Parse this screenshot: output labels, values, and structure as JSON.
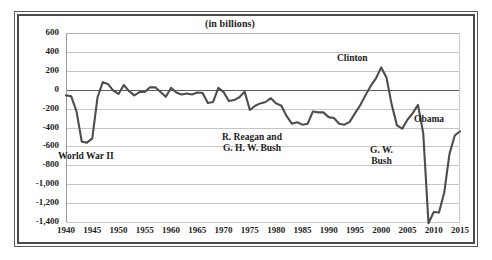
{
  "chart_data": {
    "type": "line",
    "title": "(in billions)",
    "subtitle": "",
    "xlabel": "",
    "ylabel": "",
    "xlim": [
      1940,
      2015
    ],
    "ylim": [
      -1400,
      600
    ],
    "grid": true,
    "legend_position": "none",
    "line_color": "#4d4d4d",
    "x_ticks": [
      1940,
      1945,
      1950,
      1955,
      1960,
      1965,
      1970,
      1975,
      1980,
      1985,
      1990,
      1995,
      2000,
      2005,
      2010,
      2015
    ],
    "y_ticks": [
      600,
      400,
      200,
      0,
      -200,
      -400,
      -600,
      -800,
      -1000,
      -1200,
      -1400
    ],
    "y_tick_labels": [
      "600",
      "400",
      "200",
      "0",
      "-200",
      "-400",
      "-600",
      "-800",
      "-1,000",
      "-1,200",
      "-1,400"
    ],
    "series": [
      {
        "name": "Federal surplus or deficit",
        "x": [
          1940,
          1941,
          1942,
          1943,
          1944,
          1945,
          1946,
          1947,
          1948,
          1949,
          1950,
          1951,
          1952,
          1953,
          1954,
          1955,
          1956,
          1957,
          1958,
          1959,
          1960,
          1961,
          1962,
          1963,
          1964,
          1965,
          1966,
          1967,
          1968,
          1969,
          1970,
          1971,
          1972,
          1973,
          1974,
          1975,
          1976,
          1977,
          1978,
          1979,
          1980,
          1981,
          1982,
          1983,
          1984,
          1985,
          1986,
          1987,
          1988,
          1989,
          1990,
          1991,
          1992,
          1993,
          1994,
          1995,
          1996,
          1997,
          1998,
          1999,
          2000,
          2001,
          2002,
          2003,
          2004,
          2005,
          2006,
          2007,
          2008,
          2009,
          2010,
          2011,
          2012,
          2013,
          2014,
          2015
        ],
        "values": [
          -60,
          -70,
          -230,
          -550,
          -560,
          -515,
          -80,
          80,
          60,
          -10,
          -45,
          50,
          -15,
          -60,
          -25,
          -25,
          25,
          25,
          -25,
          -75,
          20,
          -30,
          -50,
          -40,
          -50,
          -30,
          -35,
          -140,
          -130,
          20,
          -25,
          -120,
          -110,
          -80,
          -20,
          -215,
          -170,
          -145,
          -130,
          -90,
          -145,
          -170,
          -280,
          -360,
          -345,
          -370,
          -360,
          -230,
          -240,
          -240,
          -290,
          -300,
          -360,
          -370,
          -340,
          -250,
          -165,
          -60,
          40,
          120,
          236,
          128,
          -158,
          -378,
          -413,
          -318,
          -248,
          -161,
          -459,
          -1413,
          -1294,
          -1300,
          -1087,
          -680,
          -485,
          -440
        ],
        "approximate": true
      }
    ],
    "annotations": [
      {
        "id": "wwii",
        "text": "World War II",
        "x_left": 58,
        "y_top": 151,
        "align": "left"
      },
      {
        "id": "reagan-bush",
        "text": "R. Reagan and\nG. H. W. Bush",
        "x_left": 222,
        "y_top": 132,
        "align": "center"
      },
      {
        "id": "clinton",
        "text": "Clinton",
        "x_left": 337,
        "y_top": 53,
        "align": "center"
      },
      {
        "id": "gw-bush",
        "text": "G. W.\nBush",
        "x_left": 370,
        "y_top": 145,
        "align": "center"
      },
      {
        "id": "obama",
        "text": "Obama",
        "x_left": 414,
        "y_top": 114,
        "align": "center"
      }
    ]
  }
}
